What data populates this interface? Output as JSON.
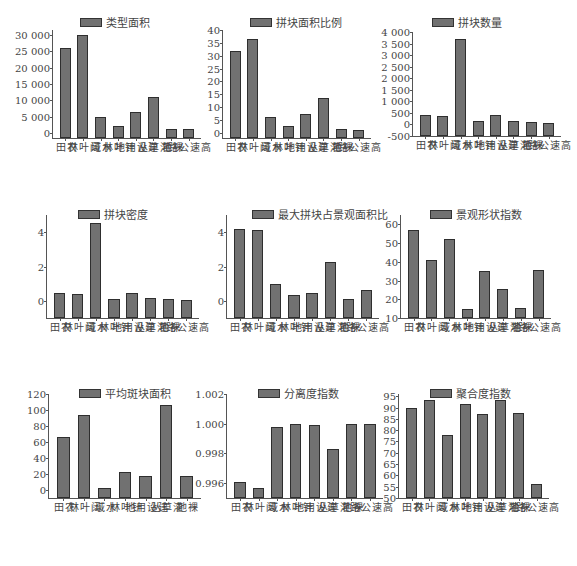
{
  "figure": {
    "categories": [
      "农田",
      "阔叶林",
      "水域",
      "针叶林",
      "建设用地",
      "灌草丛",
      "裸地",
      "高速公路"
    ]
  },
  "chart_data": [
    {
      "type": "bar",
      "title": "类型面积",
      "legend": [
        "类型面积"
      ],
      "categories": [
        "农田",
        "阔叶林",
        "水域",
        "针叶林",
        "建设用地",
        "灌草丛",
        "裸地",
        "高速公路"
      ],
      "values": [
        26000,
        30000,
        5000,
        2300,
        6300,
        11000,
        1400,
        1100
      ],
      "yticks": [
        "0",
        "5 000",
        "10 000",
        "15 000",
        "20 000",
        "25 000",
        "30 000"
      ],
      "ylim": [
        -1500,
        31500
      ],
      "tickvals": [
        0,
        5000,
        10000,
        15000,
        20000,
        25000,
        30000
      ]
    },
    {
      "type": "bar",
      "title": "拼块面积比例",
      "legend": [
        "拼块面积比例"
      ],
      "categories": [
        "农田",
        "阔叶林",
        "水域",
        "针叶林",
        "建设用地",
        "灌草丛",
        "裸地",
        "高速公路"
      ],
      "values": [
        32,
        36.5,
        6,
        2.7,
        7.5,
        13.5,
        1.5,
        1
      ],
      "yticks": [
        "0",
        "5",
        "10",
        "15",
        "20",
        "25",
        "30",
        "35",
        "40"
      ],
      "ylim": [
        -2,
        40
      ],
      "tickvals": [
        0,
        5,
        10,
        15,
        20,
        25,
        30,
        35,
        40
      ]
    },
    {
      "type": "bar",
      "title": "拼块数量",
      "legend": [
        "拼块数量"
      ],
      "categories": [
        "农田",
        "阔叶林",
        "水域",
        "针叶林",
        "建设用地",
        "灌草丛",
        "裸地",
        "高速公路"
      ],
      "values": [
        400,
        350,
        3700,
        150,
        400,
        150,
        120,
        60
      ],
      "yticks": [
        "-500",
        "0",
        "500",
        "1 000",
        "1 500",
        "2 000",
        "2 500",
        "3 000",
        "3 500",
        "4 000"
      ],
      "ylim": [
        -500,
        4000
      ],
      "tickvals": [
        -500,
        0,
        500,
        1000,
        1500,
        2000,
        2500,
        3000,
        3500,
        4000
      ]
    },
    {
      "type": "bar",
      "title": "拼块密度",
      "legend": [
        "拼块密度"
      ],
      "categories": [
        "农田",
        "阔叶林",
        "水域",
        "针叶林",
        "建设用地",
        "灌草丛",
        "裸地",
        "高速公路"
      ],
      "values": [
        0.45,
        0.4,
        4.55,
        0.12,
        0.45,
        0.14,
        0.1,
        0.05
      ],
      "yticks": [
        "0",
        "2",
        "4"
      ],
      "ylim": [
        -1,
        5
      ],
      "tickvals": [
        0,
        2,
        4
      ]
    },
    {
      "type": "bar",
      "title": "最大拼块占景观面积比",
      "legend": [
        "最大拼块占景观面积比"
      ],
      "categories": [
        "农田",
        "阔叶林",
        "水域",
        "针叶林",
        "建设用地",
        "灌草丛",
        "裸地",
        "高速公路"
      ],
      "values": [
        4.2,
        4.15,
        1.0,
        0.35,
        0.45,
        2.25,
        0.1,
        0.65
      ],
      "yticks": [
        "0",
        "2",
        "4"
      ],
      "ylim": [
        -1,
        5
      ],
      "tickvals": [
        0,
        2,
        4
      ]
    },
    {
      "type": "bar",
      "title": "景观形状指数",
      "legend": [
        "景观形状指数"
      ],
      "categories": [
        "农田",
        "阔叶林",
        "水域",
        "针叶林",
        "建设用地",
        "灌草丛",
        "裸地",
        "高速公路"
      ],
      "values": [
        57,
        41,
        52,
        15,
        35,
        25.5,
        15.5,
        35.5
      ],
      "yticks": [
        "10",
        "20",
        "30",
        "40",
        "50",
        "60"
      ],
      "ylim": [
        10,
        65
      ],
      "tickvals": [
        10,
        20,
        30,
        40,
        50,
        60
      ]
    },
    {
      "type": "bar",
      "title": "平均斑块面积",
      "legend": [
        "平均斑块面积"
      ],
      "categories": [
        "农田",
        "阔叶林",
        "水域",
        "针叶林",
        "建设用地",
        "灌草丛",
        "裸地"
      ],
      "values": [
        66,
        94,
        2,
        23,
        18,
        106,
        18
      ],
      "yticks": [
        "0",
        "20",
        "40",
        "60",
        "80",
        "100",
        "120"
      ],
      "ylim": [
        -10,
        120
      ],
      "tickvals": [
        0,
        20,
        40,
        60,
        80,
        100,
        120
      ]
    },
    {
      "type": "bar",
      "title": "分离度指数",
      "legend": [
        "分离度指数"
      ],
      "categories": [
        "农田",
        "阔叶林",
        "水域",
        "针叶林",
        "建设用地",
        "灌草丛",
        "裸地",
        "高速公路"
      ],
      "values": [
        0.9961,
        0.9957,
        0.9998,
        1.0,
        0.9999,
        0.9983,
        1.0,
        1.0
      ],
      "yticks": [
        "0.996",
        "0.998",
        "1.000",
        "1.002"
      ],
      "ylim": [
        0.995,
        1.002
      ],
      "tickvals": [
        0.996,
        0.998,
        1.0,
        1.002
      ]
    },
    {
      "type": "bar",
      "title": "聚合度指数",
      "legend": [
        "聚合度指数"
      ],
      "categories": [
        "农田",
        "阔叶林",
        "水域",
        "针叶林",
        "建设用地",
        "灌草丛",
        "裸地",
        "高速公路"
      ],
      "values": [
        90,
        93.5,
        78,
        91.5,
        87,
        93.5,
        87.5,
        56
      ],
      "yticks": [
        "50",
        "55",
        "60",
        "65",
        "70",
        "75",
        "80",
        "85",
        "90",
        "95"
      ],
      "ylim": [
        50,
        96
      ],
      "tickvals": [
        50,
        55,
        60,
        65,
        70,
        75,
        80,
        85,
        90,
        95
      ]
    }
  ],
  "layout": {
    "bar_color": "#717171",
    "grid": false,
    "legend_position": "top"
  }
}
